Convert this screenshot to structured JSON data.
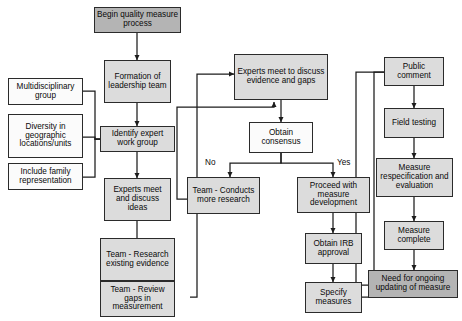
{
  "diagram": {
    "colors": {
      "start_fill": "#b4b4b4",
      "process_fill": "#dcdcdc",
      "decision_fill": "#fbfbfb",
      "stroke": "#2b2b2b",
      "text": "#0a0a0a",
      "background": "#ffffff"
    },
    "nodes": [
      {
        "id": "begin",
        "label": "Begin quality measure process",
        "style": "dark"
      },
      {
        "id": "formation",
        "label": "Formation of leadership team",
        "style": "light"
      },
      {
        "id": "identify",
        "label": "Identify expert work group",
        "style": "light"
      },
      {
        "id": "experts_ideas",
        "label": "Experts meet and discuss ideas",
        "style": "light"
      },
      {
        "id": "research_exist",
        "label": "Team - Research existing evidence",
        "style": "light"
      },
      {
        "id": "review_gaps",
        "label": "Team - Review gaps in measurement",
        "style": "light"
      },
      {
        "id": "multidisc",
        "label": "Multidisciplinary group",
        "style": "white"
      },
      {
        "id": "diversity",
        "label": "Diversity in geographic locations/units",
        "style": "white"
      },
      {
        "id": "family",
        "label": "Include family representation",
        "style": "white"
      },
      {
        "id": "experts_evidence",
        "label": "Experts meet to discuss evidence and gaps",
        "style": "light"
      },
      {
        "id": "consensus",
        "label": "Obtain consensus",
        "style": "white"
      },
      {
        "id": "more_research",
        "label": "Team - Conducts more research",
        "style": "light"
      },
      {
        "id": "proceed",
        "label": "Proceed with measure development",
        "style": "light"
      },
      {
        "id": "irb",
        "label": "Obtain IRB approval",
        "style": "light"
      },
      {
        "id": "specify",
        "label": "Specify measures",
        "style": "light"
      },
      {
        "id": "public_comment",
        "label": "Public comment",
        "style": "light"
      },
      {
        "id": "field_testing",
        "label": "Field testing",
        "style": "light"
      },
      {
        "id": "respec",
        "label": "Measure respecification and evaluation",
        "style": "light"
      },
      {
        "id": "complete",
        "label": "Measure complete",
        "style": "light"
      },
      {
        "id": "ongoing",
        "label": "Need for ongoing updating of measure",
        "style": "dark"
      }
    ],
    "edge_labels": [
      {
        "id": "no",
        "text": "No"
      },
      {
        "id": "yes",
        "text": "Yes"
      }
    ]
  }
}
